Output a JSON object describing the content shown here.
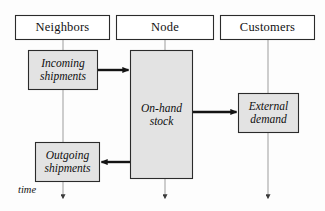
{
  "figure": {
    "kind": "swimlane-flow-diagram",
    "background_color": "#fdfdfd",
    "line_color": "#1a1a1a",
    "box_fill_color": "#e3e3e3",
    "header_fill_color": "#ffffff",
    "timeline_color": "#9a9a9a"
  },
  "lanes": [
    {
      "id": "neighbors",
      "label": "Neighbors",
      "timeline_x": 63
    },
    {
      "id": "node",
      "label": "Node",
      "timeline_x": 165
    },
    {
      "id": "customers",
      "label": "Customers",
      "timeline_x": 268
    }
  ],
  "processes": [
    {
      "id": "incoming-shipments",
      "lane": "neighbors",
      "line1": "Incoming",
      "line2": "shipments"
    },
    {
      "id": "on-hand-stock",
      "lane": "node",
      "line1": "On-hand",
      "line2": "stock"
    },
    {
      "id": "external-demand",
      "lane": "customers",
      "line1": "External",
      "line2": "demand"
    },
    {
      "id": "outgoing-shipments",
      "lane": "neighbors",
      "line1": "Outgoing",
      "line2": "shipments"
    }
  ],
  "flows": [
    {
      "id": "incoming-to-stock",
      "from": "incoming-shipments",
      "to": "on-hand-stock",
      "direction": "right"
    },
    {
      "id": "stock-to-demand",
      "from": "on-hand-stock",
      "to": "external-demand",
      "direction": "right"
    },
    {
      "id": "stock-to-outgoing",
      "from": "on-hand-stock",
      "to": "outgoing-shipments",
      "direction": "left"
    }
  ],
  "axis": {
    "label": "time",
    "direction": "downward"
  }
}
